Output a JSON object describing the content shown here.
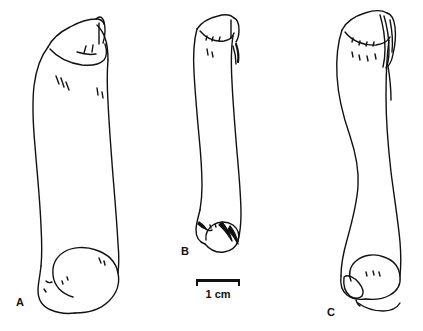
{
  "figure": {
    "type": "scientific-line-illustration",
    "background_color": "#ffffff",
    "ink_color": "#111111",
    "width": 423,
    "height": 331
  },
  "specimens": [
    {
      "id": "A",
      "label": "A",
      "label_position": {
        "x": 16,
        "y": 297
      },
      "description": "largest bone, straight shaft, expanded proximal end with notch, large rounded distal condyle",
      "bounds": {
        "x": 26,
        "y": 6,
        "width": 108,
        "height": 308
      }
    },
    {
      "id": "B",
      "label": "B",
      "label_position": {
        "x": 181,
        "y": 246
      },
      "description": "smallest bone, slender slightly curved shaft, hooked distal end with shaded trochlea",
      "bounds": {
        "x": 190,
        "y": 7,
        "width": 62,
        "height": 251
      }
    },
    {
      "id": "C",
      "label": "C",
      "label_position": {
        "x": 327,
        "y": 307
      },
      "description": "sigmoid curved shaft, bevelled proximal end, broad distal condyle with foramina",
      "bounds": {
        "x": 330,
        "y": 7,
        "width": 80,
        "height": 315
      }
    }
  ],
  "scale_bar": {
    "label": "1 cm",
    "length_px": 44,
    "position": {
      "x": 196,
      "y": 279
    },
    "tick_style": "downward end ticks"
  }
}
